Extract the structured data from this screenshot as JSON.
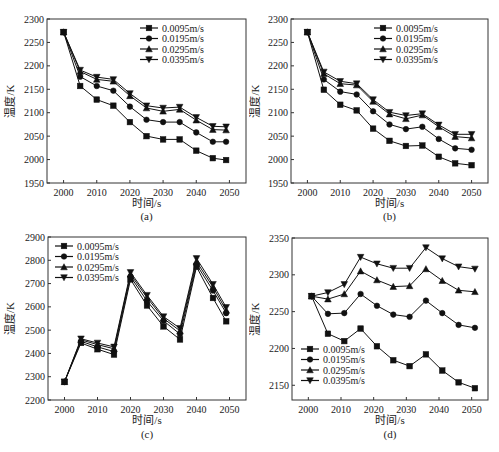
{
  "chart_data": [
    {
      "id": "a",
      "type": "line",
      "caption": "(a)",
      "title": "",
      "xlabel": "时间/s",
      "ylabel": "温度/K",
      "xlim": [
        1995,
        2055
      ],
      "ylim": [
        1950,
        2300
      ],
      "xticks": [
        2000,
        2010,
        2020,
        2030,
        2040,
        2050
      ],
      "yticks": [
        1950,
        2000,
        2050,
        2100,
        2150,
        2200,
        2250,
        2300
      ],
      "grid": false,
      "legend_position": "upper right",
      "x": [
        2000,
        2005,
        2010,
        2015,
        2020,
        2025,
        2030,
        2035,
        2040,
        2045,
        2049
      ],
      "series": [
        {
          "name": "0.0095m/s",
          "marker": "square",
          "values": [
            2272,
            2157,
            2128,
            2115,
            2080,
            2050,
            2043,
            2043,
            2019,
            2003,
            1999
          ]
        },
        {
          "name": "0.0195m/s",
          "marker": "circle",
          "values": [
            2272,
            2177,
            2157,
            2147,
            2113,
            2085,
            2080,
            2080,
            2058,
            2038,
            2038
          ]
        },
        {
          "name": "0.0295m/s",
          "marker": "triangle-up",
          "values": [
            2272,
            2188,
            2171,
            2167,
            2136,
            2110,
            2103,
            2107,
            2084,
            2064,
            2063
          ]
        },
        {
          "name": "0.0395m/s",
          "marker": "triangle-down",
          "values": [
            2272,
            2191,
            2176,
            2171,
            2141,
            2115,
            2110,
            2112,
            2090,
            2071,
            2070
          ]
        }
      ]
    },
    {
      "id": "b",
      "type": "line",
      "caption": "(b)",
      "title": "",
      "xlabel": "时间/s",
      "ylabel": "温度/K",
      "xlim": [
        1995,
        2055
      ],
      "ylim": [
        1950,
        2300
      ],
      "xticks": [
        2000,
        2010,
        2020,
        2030,
        2040,
        2050
      ],
      "yticks": [
        1950,
        2000,
        2050,
        2100,
        2150,
        2200,
        2250,
        2300
      ],
      "grid": false,
      "legend_position": "upper right",
      "x": [
        2000,
        2005,
        2010,
        2015,
        2020,
        2025,
        2030,
        2035,
        2040,
        2045,
        2050
      ],
      "series": [
        {
          "name": "0.0095m/s",
          "marker": "square",
          "values": [
            2272,
            2149,
            2117,
            2105,
            2066,
            2040,
            2029,
            2030,
            2006,
            1992,
            1988
          ]
        },
        {
          "name": "0.0195m/s",
          "marker": "circle",
          "values": [
            2272,
            2171,
            2145,
            2139,
            2103,
            2075,
            2065,
            2070,
            2044,
            2024,
            2021
          ]
        },
        {
          "name": "0.0295m/s",
          "marker": "triangle-up",
          "values": [
            2272,
            2183,
            2162,
            2159,
            2124,
            2097,
            2087,
            2095,
            2070,
            2049,
            2046
          ]
        },
        {
          "name": "0.0395m/s",
          "marker": "triangle-down",
          "values": [
            2272,
            2187,
            2167,
            2162,
            2128,
            2101,
            2094,
            2098,
            2074,
            2054,
            2054
          ]
        }
      ]
    },
    {
      "id": "c",
      "type": "line",
      "caption": "(c)",
      "title": "",
      "xlabel": "时间/s",
      "ylabel": "温度/K",
      "xlim": [
        1995,
        2055
      ],
      "ylim": [
        2200,
        2900
      ],
      "xticks": [
        2000,
        2010,
        2020,
        2030,
        2040,
        2050
      ],
      "yticks": [
        2200,
        2300,
        2400,
        2500,
        2600,
        2700,
        2800,
        2900
      ],
      "grid": false,
      "legend_position": "upper left",
      "x": [
        2000,
        2005,
        2010,
        2015,
        2020,
        2025,
        2030,
        2035,
        2040,
        2045,
        2049
      ],
      "series": [
        {
          "name": "0.0095m/s",
          "marker": "square",
          "values": [
            2278,
            2445,
            2418,
            2395,
            2718,
            2606,
            2516,
            2460,
            2772,
            2638,
            2538
          ]
        },
        {
          "name": "0.0195m/s",
          "marker": "circle",
          "values": [
            2278,
            2452,
            2428,
            2408,
            2730,
            2625,
            2540,
            2483,
            2782,
            2670,
            2573
          ]
        },
        {
          "name": "0.0295m/s",
          "marker": "triangle-up",
          "values": [
            2278,
            2458,
            2438,
            2420,
            2740,
            2640,
            2550,
            2497,
            2795,
            2685,
            2585
          ]
        },
        {
          "name": "0.0395m/s",
          "marker": "triangle-down",
          "values": [
            2278,
            2463,
            2445,
            2428,
            2748,
            2650,
            2558,
            2508,
            2808,
            2697,
            2598
          ]
        }
      ]
    },
    {
      "id": "d",
      "type": "line",
      "caption": "(d)",
      "title": "",
      "xlabel": "时间/s",
      "ylabel": "温度/K",
      "xlim": [
        1995,
        2055
      ],
      "ylim": [
        2130,
        2350
      ],
      "xticks": [
        2000,
        2010,
        2020,
        2030,
        2040,
        2050
      ],
      "yticks": [
        2150,
        2200,
        2250,
        2300,
        2350
      ],
      "grid": false,
      "legend_position": "lower left",
      "x": [
        2001,
        2006,
        2011,
        2016,
        2021,
        2026,
        2031,
        2036,
        2041,
        2046,
        2051
      ],
      "series": [
        {
          "name": "0.0095m/s",
          "marker": "square",
          "values": [
            2271,
            2220,
            2210,
            2227,
            2203,
            2184,
            2176,
            2192,
            2170,
            2154,
            2146
          ]
        },
        {
          "name": "0.0195m/s",
          "marker": "circle",
          "values": [
            2271,
            2247,
            2248,
            2274,
            2258,
            2246,
            2243,
            2265,
            2248,
            2232,
            2228
          ]
        },
        {
          "name": "0.0295m/s",
          "marker": "triangle-up",
          "values": [
            2271,
            2267,
            2274,
            2305,
            2293,
            2284,
            2285,
            2308,
            2292,
            2279,
            2277
          ]
        },
        {
          "name": "0.0395m/s",
          "marker": "triangle-down",
          "values": [
            2271,
            2276,
            2287,
            2324,
            2315,
            2309,
            2309,
            2337,
            2322,
            2311,
            2308
          ]
        }
      ]
    }
  ]
}
